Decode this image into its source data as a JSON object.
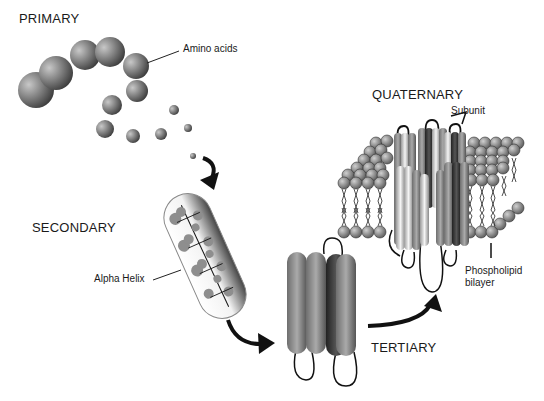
{
  "diagram": {
    "stages": {
      "primary": "PRIMARY",
      "secondary": "SECONDARY",
      "tertiary": "TERTIARY",
      "quaternary": "QUATERNARY"
    },
    "callouts": {
      "amino_acids": "Amino acids",
      "alpha_helix": "Alpha Helix",
      "subunit": "Subunit",
      "phospholipid_line1": "Phospholipid",
      "phospholipid_line2": "bilayer"
    },
    "colors": {
      "background": "#ffffff",
      "sphere_dark": "#3a3a3a",
      "sphere_light": "#bdbdbd",
      "helix_light": "#e6e6e6",
      "helix_dark": "#555555",
      "lipid_head": "#8c8c8c",
      "arrow": "#111111"
    }
  }
}
